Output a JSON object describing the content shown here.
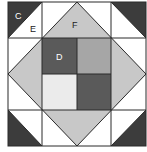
{
  "diagram": {
    "title": "",
    "type": "quilt-block",
    "labels": {
      "C": "C",
      "D": "D",
      "E": "E",
      "F": "F"
    },
    "colors": {
      "background": "#ffffff",
      "dark": "#3c3c3c",
      "medium_dark": "#5a5a5a",
      "medium": "#a6a6a6",
      "light_gray": "#c8c8c8",
      "very_light": "#ebebeb",
      "line": "#2a2a2a"
    },
    "pieces": [
      {
        "id": "corner-tl",
        "shape": "half-square triangle",
        "color": "dark",
        "label": "C"
      },
      {
        "id": "corner-tr",
        "shape": "half-square triangle",
        "color": "dark"
      },
      {
        "id": "corner-bl",
        "shape": "half-square triangle",
        "color": "dark"
      },
      {
        "id": "corner-br",
        "shape": "half-square triangle",
        "color": "dark"
      },
      {
        "id": "white-triangles",
        "shape": "triangle",
        "color": "background",
        "label": "E"
      },
      {
        "id": "diamond-triangles",
        "shape": "triangle",
        "color": "light_gray",
        "label": "F"
      },
      {
        "id": "center-tl",
        "shape": "square",
        "color": "medium_dark",
        "label": "D"
      },
      {
        "id": "center-tr",
        "shape": "square",
        "color": "medium"
      },
      {
        "id": "center-bl",
        "shape": "square",
        "color": "very_light"
      },
      {
        "id": "center-br",
        "shape": "square",
        "color": "medium_dark"
      }
    ]
  }
}
